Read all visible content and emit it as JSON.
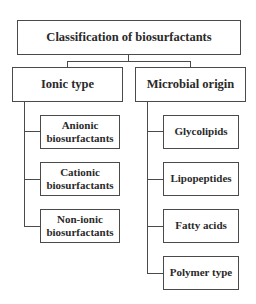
{
  "diagram": {
    "type": "classification-tree",
    "root": {
      "label": "Classification of biosurfactants"
    },
    "branches": [
      {
        "label": "Ionic type",
        "children": [
          {
            "label": "Anionic\nbiosurfactants"
          },
          {
            "label": "Cationic\nbiosurfactants"
          },
          {
            "label": "Non-ionic\nbiosurfactants"
          }
        ]
      },
      {
        "label": "Microbial origin",
        "children": [
          {
            "label": "Glycolipids"
          },
          {
            "label": "Lipopeptides"
          },
          {
            "label": "Fatty acids"
          },
          {
            "label": "Polymer type"
          }
        ]
      }
    ],
    "colors": {
      "line": "#4a4a4a",
      "text": "#2a2a2a",
      "background": "#ffffff"
    }
  }
}
